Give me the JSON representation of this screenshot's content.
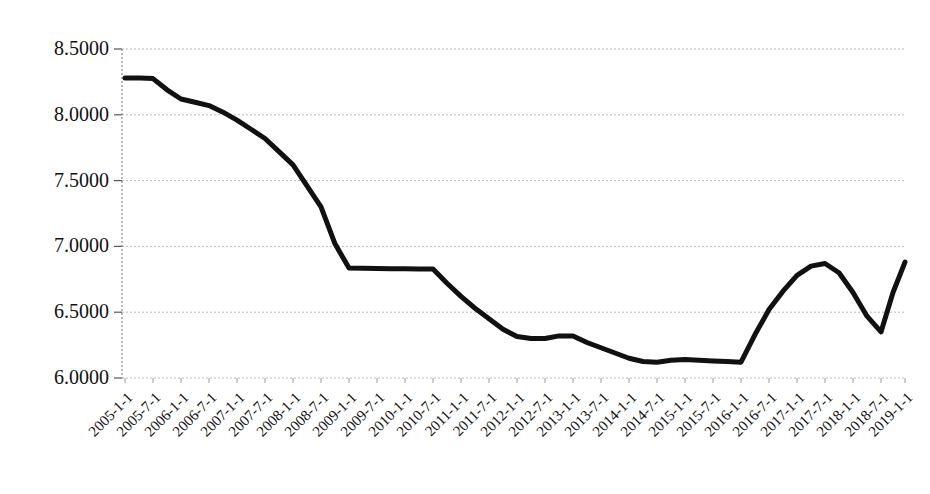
{
  "chart_data": {
    "type": "line",
    "title": "",
    "subtitle": "",
    "xlabel": "",
    "ylabel": "",
    "grid": true,
    "legend": false,
    "legend_position": "none",
    "series_color": "#111111",
    "gridline_color": "#b9b9b9",
    "axis_color": "#8a8a8a",
    "background_color": "#ffffff",
    "ylim": [
      6.0,
      8.5
    ],
    "yticks": [
      6.0,
      6.5,
      7.0,
      7.5,
      8.0,
      8.5
    ],
    "ytick_labels": [
      "6.0000",
      "6.5000",
      "7.0000",
      "7.5000",
      "8.0000",
      "8.5000"
    ],
    "xtick_labels": [
      "2005-1-1",
      "2005-7-1",
      "2006-1-1",
      "2006-7-1",
      "2007-1-1",
      "2007-7-1",
      "2008-1-1",
      "2008-7-1",
      "2009-1-1",
      "2009-7-1",
      "2010-1-1",
      "2010-7-1",
      "2011-1-1",
      "2011-7-1",
      "2012-1-1",
      "2012-7-1",
      "2013-1-1",
      "2013-7-1",
      "2014-1-1",
      "2014-7-1",
      "2015-1-1",
      "2015-7-1",
      "2016-1-1",
      "2016-7-1",
      "2017-1-1",
      "2017-7-1",
      "2018-1-1",
      "2018-7-1",
      "2019-1-1"
    ],
    "categories": [
      "2005-1-1",
      "2005-7-1",
      "2006-1-1",
      "2006-7-1",
      "2007-1-1",
      "2007-7-1",
      "2008-1-1",
      "2008-7-1",
      "2009-1-1",
      "2009-7-1",
      "2010-1-1",
      "2010-7-1",
      "2011-1-1",
      "2011-7-1",
      "2012-1-1",
      "2012-7-1",
      "2013-1-1",
      "2013-7-1",
      "2014-1-1",
      "2014-7-1",
      "2015-1-1",
      "2015-7-1",
      "2016-1-1",
      "2016-7-1",
      "2017-1-1",
      "2017-7-1",
      "2018-1-1",
      "2018-7-1",
      "2019-1-1"
    ],
    "values": [
      8.28,
      8.275,
      8.12,
      8.07,
      7.96,
      7.82,
      7.62,
      7.3,
      6.835,
      6.832,
      6.83,
      6.828,
      6.62,
      6.45,
      6.315,
      6.3,
      6.32,
      6.23,
      6.15,
      6.12,
      6.14,
      6.13,
      6.12,
      6.52,
      6.78,
      6.87,
      6.65,
      6.35,
      6.88
    ],
    "x_pixels": [
      125,
      153,
      181,
      209,
      237,
      265,
      293,
      321,
      349,
      377,
      405,
      433,
      461,
      489,
      517,
      545,
      573,
      601,
      629,
      657,
      685,
      713,
      741,
      769,
      797,
      825,
      853,
      881,
      905
    ],
    "dense_x_pixels": [
      125,
      140,
      153,
      167,
      181,
      195,
      209,
      223,
      237,
      251,
      265,
      279,
      293,
      307,
      321,
      335,
      349,
      363,
      377,
      391,
      405,
      419,
      433,
      447,
      461,
      475,
      489,
      503,
      517,
      531,
      545,
      559,
      573,
      587,
      601,
      615,
      629,
      643,
      657,
      671,
      685,
      699,
      713,
      727,
      741,
      755,
      769,
      783,
      797,
      811,
      825,
      839,
      853,
      867,
      881,
      893,
      905
    ],
    "dense_values": [
      8.28,
      8.28,
      8.275,
      8.19,
      8.12,
      8.095,
      8.07,
      8.02,
      7.96,
      7.89,
      7.82,
      7.72,
      7.62,
      7.46,
      7.3,
      7.02,
      6.835,
      6.834,
      6.832,
      6.831,
      6.83,
      6.829,
      6.828,
      6.72,
      6.62,
      6.53,
      6.45,
      6.37,
      6.315,
      6.3,
      6.3,
      6.32,
      6.32,
      6.27,
      6.23,
      6.19,
      6.15,
      6.125,
      6.12,
      6.135,
      6.14,
      6.135,
      6.13,
      6.125,
      6.12,
      6.33,
      6.52,
      6.66,
      6.78,
      6.85,
      6.87,
      6.8,
      6.65,
      6.47,
      6.35,
      6.65,
      6.88
    ],
    "annotations": [],
    "notes": {
      "min_value": 6.12,
      "max_value": 8.28,
      "plateau_value": 6.83,
      "plateau_range": "2009-1-1 to 2010-7-1"
    }
  },
  "layout": {
    "plot_left_px": 122,
    "plot_right_px": 905,
    "plot_top_px": 49,
    "plot_bottom_px": 378,
    "y_pixel_per_unit": 131.6,
    "line_width_px": 5
  }
}
